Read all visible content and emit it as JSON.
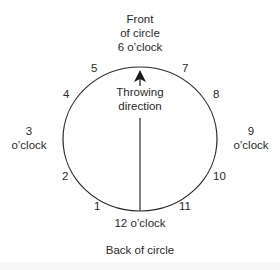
{
  "diagram": {
    "title_top": [
      "Front",
      "of circle",
      "6 o’clock"
    ],
    "bottom_label": "12 o’clock",
    "bottom_caption": "Back of circle",
    "left_label": [
      "3",
      "o’clock"
    ],
    "right_label": [
      "9",
      "o’clock"
    ],
    "center_label": [
      "Throwing",
      "direction"
    ],
    "hour_numbers": {
      "h1": "1",
      "h2": "2",
      "h4": "4",
      "h5": "5",
      "h7": "7",
      "h8": "8",
      "h10": "10",
      "h11": "11"
    },
    "colors": {
      "stroke": "#2a2a2a",
      "background": "#ffffff"
    }
  }
}
